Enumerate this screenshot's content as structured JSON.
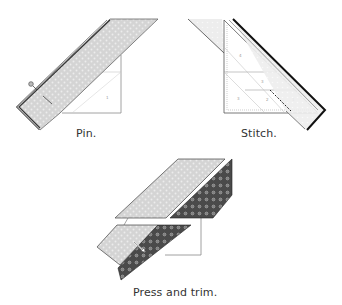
{
  "steps": [
    {
      "id": "pin",
      "caption": "Pin."
    },
    {
      "id": "stitch",
      "caption": "Stitch."
    },
    {
      "id": "press-trim",
      "caption": "Press and trim."
    }
  ],
  "block_numbers": {
    "pin": [
      "1"
    ],
    "stitch": [
      "4",
      "3",
      "3",
      "2",
      "1"
    ]
  },
  "colors": {
    "light_fabric": "#d4d4d4",
    "light_fabric_dots": "#ececec",
    "dark_fabric": "#4a4a4a",
    "dark_fabric_dots": "#c8c8c8",
    "outline": "#333333",
    "paper_line": "#8a8a8a",
    "caption_text": "#333333"
  }
}
